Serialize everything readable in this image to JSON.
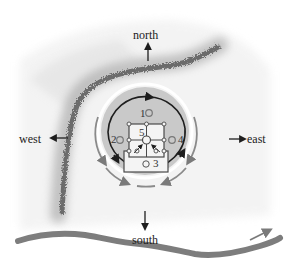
{
  "diagram": {
    "type": "site-plan",
    "directions": {
      "north": "north",
      "south": "south",
      "east": "east",
      "west": "west"
    },
    "markers": {
      "m1": "1",
      "m2": "2",
      "m3": "3",
      "m4": "4",
      "m5": "5"
    },
    "colors": {
      "background": "#ffffff",
      "ridge": "#6a6a6a",
      "river": "#7d7d7d",
      "disk": "#c9c9c9",
      "ring": "#1e1e1e",
      "outer_arcs": "#8a8a8a",
      "building": "#f4f4f4",
      "building_stroke": "#4a4a4a"
    }
  }
}
